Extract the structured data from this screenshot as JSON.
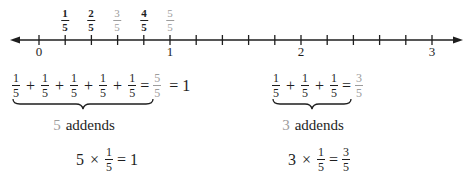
{
  "number_line": {
    "axis_y": 40,
    "x_start": 12,
    "x_end": 462,
    "unit_px": 131,
    "origin_x": 39,
    "ticks_per_unit": 5,
    "integer_labels": [
      {
        "value": 0,
        "label": "0",
        "x": 39
      },
      {
        "value": 1,
        "label": "1",
        "x": 170
      },
      {
        "value": 2,
        "label": "2",
        "x": 301
      },
      {
        "value": 3,
        "label": "3",
        "x": 432
      }
    ],
    "fraction_labels": [
      {
        "num": "1",
        "den": "5",
        "x": 65,
        "style": "dark"
      },
      {
        "num": "2",
        "den": "5",
        "x": 91,
        "style": "dark"
      },
      {
        "num": "3",
        "den": "5",
        "x": 117,
        "style": "grey"
      },
      {
        "num": "4",
        "den": "5",
        "x": 144,
        "style": "dark"
      },
      {
        "num": "5",
        "den": "5",
        "x": 170,
        "style": "grey"
      }
    ],
    "arrows": [
      "left",
      "right"
    ]
  },
  "left_example": {
    "addend": {
      "num": "1",
      "den": "5"
    },
    "addend_count": 5,
    "plus": "+",
    "equals": "=",
    "sum": {
      "num": "5",
      "den": "5"
    },
    "result": "1",
    "addends_caption": {
      "count": "5",
      "word": "addends"
    },
    "product": {
      "factor": "5",
      "times": "×",
      "fraction": {
        "num": "1",
        "den": "5"
      },
      "equals": "=",
      "result": "1"
    }
  },
  "right_example": {
    "addend": {
      "num": "1",
      "den": "5"
    },
    "addend_count": 3,
    "plus": "+",
    "equals": "=",
    "sum": {
      "num": "3",
      "den": "5"
    },
    "addends_caption": {
      "count": "3",
      "word": "addends"
    },
    "product": {
      "factor": "3",
      "times": "×",
      "fraction": {
        "num": "1",
        "den": "5"
      },
      "equals": "=",
      "result": {
        "num": "3",
        "den": "5"
      }
    }
  },
  "colors": {
    "ink": "#1e1e1e",
    "highlight_grey": "#9c9c9c",
    "background": "#ffffff"
  }
}
